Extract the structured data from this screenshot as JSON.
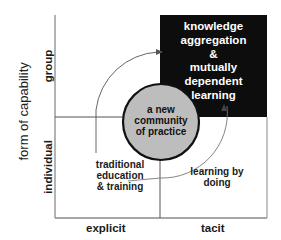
{
  "diagram": {
    "y_axis_title": "form of capability",
    "y_axis_labels": {
      "top": "group",
      "bottom": "individual"
    },
    "x_axis_labels": {
      "left": "explicit",
      "right": "tacit"
    },
    "quadrants": {
      "top_right": [
        "knowledge",
        "aggregation",
        "&",
        "mutually",
        "dependent",
        "learning"
      ],
      "bottom_left": [
        "traditional",
        "education",
        "& training"
      ],
      "bottom_right": [
        "learning by",
        "doing"
      ]
    },
    "center": [
      "a new",
      "community",
      "of practice"
    ],
    "colors": {
      "highlight_quadrant": "#0d0d0d",
      "center_circle": "#bdbdbd",
      "axis_lines": "#8a8a8a",
      "arcs": "#555555"
    }
  }
}
